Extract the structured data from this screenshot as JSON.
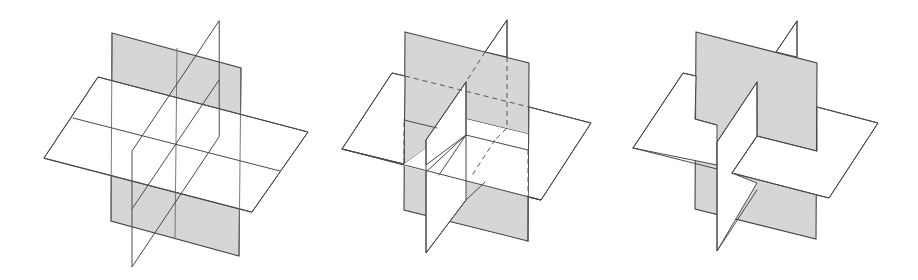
{
  "figure": {
    "colors": {
      "stroke": "#4a4a4a",
      "gray_plane_fill": "#d2d2d2",
      "white_plane_fill": "#ffffff",
      "background": "#ffffff"
    },
    "panels": [
      {
        "id": "wireframe",
        "style": "transparent wireframe with all edges visible"
      },
      {
        "id": "dashed-hidden",
        "style": "opaque planes with hidden edges shown dashed"
      },
      {
        "id": "opaque",
        "style": "opaque planes with hidden edges removed"
      }
    ]
  }
}
